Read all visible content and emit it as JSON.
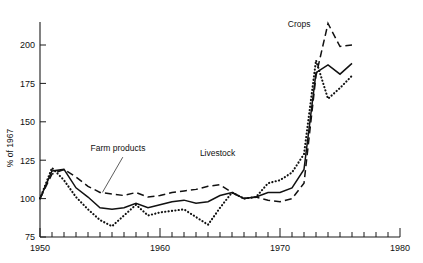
{
  "chart_data": {
    "type": "line",
    "title": "",
    "subtitle": "",
    "xlabel": "",
    "ylabel": "% of 1967",
    "xlim": [
      1950,
      1980
    ],
    "ylim": [
      75,
      215
    ],
    "grid": false,
    "legend_position": "inline-annotations",
    "y_ticks": [
      75,
      100,
      125,
      150,
      175,
      200
    ],
    "y_tick_labels": [
      "75",
      "100",
      "125",
      "150",
      "175",
      "200"
    ],
    "x_ticks": [
      1950,
      1951,
      1952,
      1953,
      1954,
      1955,
      1956,
      1957,
      1958,
      1959,
      1960,
      1961,
      1962,
      1963,
      1964,
      1965,
      1966,
      1967,
      1968,
      1969,
      1970,
      1971,
      1972,
      1973,
      1974,
      1975,
      1976,
      1977,
      1978,
      1979,
      1980
    ],
    "x_tick_labels": [
      "1950",
      "1960",
      "1970",
      "1980"
    ],
    "x_labeled_ticks": [
      1950,
      1960,
      1970,
      1980
    ],
    "annotations": [
      {
        "text": "Farm products",
        "x": 1956.5,
        "y": 131,
        "series": "Farm products"
      },
      {
        "text": "Livestock",
        "x": 1964.8,
        "y": 128,
        "series": "Livestock"
      },
      {
        "text": "Crops",
        "x": 1971.6,
        "y": 212,
        "series": "Crops"
      }
    ],
    "x": [
      1950,
      1951,
      1952,
      1953,
      1954,
      1955,
      1956,
      1957,
      1958,
      1959,
      1960,
      1961,
      1962,
      1963,
      1964,
      1965,
      1966,
      1967,
      1968,
      1969,
      1970,
      1971,
      1972,
      1973,
      1974,
      1975,
      1976
    ],
    "series": [
      {
        "name": "Farm products",
        "style": "solid",
        "values": [
          100,
          118,
          119,
          107,
          101,
          94,
          93,
          94,
          97,
          94,
          96,
          98,
          99,
          97,
          98,
          102,
          104,
          100,
          101,
          104,
          104,
          107,
          119,
          182,
          187,
          181,
          188
        ]
      },
      {
        "name": "Livestock",
        "style": "dotted",
        "values": [
          100,
          120,
          112,
          101,
          93,
          86,
          82,
          89,
          96,
          89,
          91,
          92,
          93,
          88,
          83,
          94,
          104,
          100,
          101,
          110,
          112,
          117,
          129,
          190,
          165,
          172,
          180
        ]
      },
      {
        "name": "Crops",
        "style": "dashed",
        "values": [
          100,
          116,
          119,
          114,
          108,
          104,
          103,
          102,
          104,
          101,
          102,
          104,
          105,
          106,
          108,
          109,
          104,
          100,
          101,
          99,
          98,
          100,
          110,
          180,
          214,
          199,
          200
        ]
      }
    ]
  },
  "axes": {
    "y_axis_title": "% of 1967"
  }
}
